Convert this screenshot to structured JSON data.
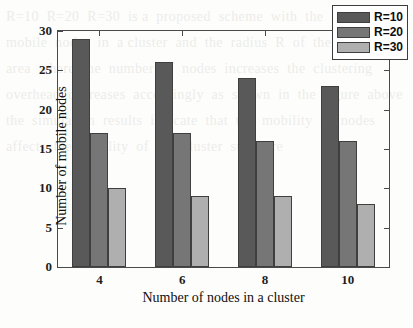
{
  "chart_data": {
    "type": "bar",
    "title": "",
    "subtitle": "",
    "xlabel": "Number of nodes in a cluster",
    "ylabel": "Number of mobile nodes",
    "categories": [
      "4",
      "6",
      "8",
      "10"
    ],
    "series": [
      {
        "name": "R=10",
        "values": [
          29,
          26,
          24,
          23
        ],
        "color": "#595959"
      },
      {
        "name": "R=20",
        "values": [
          17,
          17,
          16,
          16
        ],
        "color": "#767676"
      },
      {
        "name": "R=30",
        "values": [
          10,
          9,
          9,
          8
        ],
        "color": "#afafaf"
      }
    ],
    "ylim": [
      0,
      30
    ],
    "ytick_labels": [
      "0",
      "5",
      "10",
      "15",
      "20",
      "25",
      "30"
    ],
    "ytick_values": [
      0,
      5,
      10,
      15,
      20,
      25,
      30
    ],
    "xtick_labels": [
      "4",
      "6",
      "8",
      "10"
    ],
    "grid": false,
    "legend_position": "top-right",
    "annotations": []
  },
  "legend": {
    "entries": [
      {
        "label": "R=10",
        "color": "#595959"
      },
      {
        "label": "R=20",
        "color": "#767676"
      },
      {
        "label": "R=30",
        "color": "#afafaf"
      }
    ]
  },
  "scan": {
    "bleed_text": "R=10  R=20  R=30  is a  proposed  scheme  with  the  number  of  mobile  nodes  in  a cluster  and  the  radius  R  of  the  cluster  area  where  the  number  of  nodes  increases  the  clustering  overhead  decreases  accordingly  as  shown  in  the  figure  above  the  simulation  results  indicate  that  the  mobility  of  nodes  affects  the  stability  of  the  cluster  structure"
  }
}
